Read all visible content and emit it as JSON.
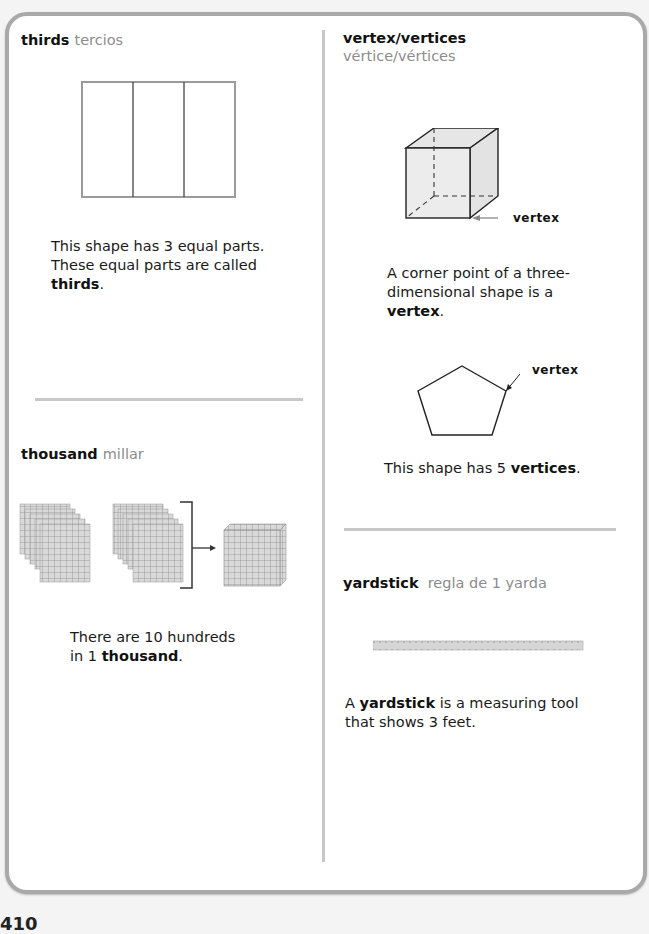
{
  "page": {
    "number": "410"
  },
  "entries": [
    {
      "term": "thirds",
      "translation": "tercios",
      "description_lines": [
        "This shape has 3 equal parts.",
        "These equal parts are called"
      ],
      "description_bold_end": "thirds",
      "description_suffix": ".",
      "figure": "rectangle divided into 3 equal parts"
    },
    {
      "term": "thousand",
      "translation": "millar",
      "description_line1": "There are 10 hundreds",
      "description_line2_prefix": "in 1 ",
      "description_line2_bold": "thousand",
      "description_line2_suffix": ".",
      "figure": "ten hundred-flats grouped by bracket with arrow to a thousand cube"
    },
    {
      "term": "vertex/vertices",
      "translation": "vértice/vértices",
      "description_line1": "A corner point of a three-",
      "description_line2": "dimensional shape is a",
      "description_bold": "vertex",
      "description_suffix": ".",
      "cube_label": "vertex",
      "pentagon_label": "vertex",
      "pentagon_desc_prefix": "This shape has 5 ",
      "pentagon_desc_bold": "vertices",
      "pentagon_desc_suffix": "."
    },
    {
      "term": "yardstick",
      "translation": "regla de 1 yarda",
      "description_prefix": "A ",
      "description_bold": "yardstick",
      "description_line1_rest": " is a measuring tool",
      "description_line2": "that shows 3 feet.",
      "figure": "yardstick ruler"
    }
  ],
  "colors": {
    "border": "#a9a9a9",
    "divider": "#c8c8c8",
    "translation": "#8c8c8c",
    "figure_fill": "#e6e6e6"
  }
}
